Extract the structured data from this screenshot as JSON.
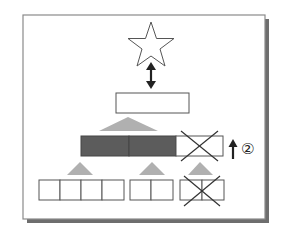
{
  "diagram": {
    "step_label": "②",
    "colors": {
      "frame_border": "#8a8a8a",
      "frame_shadow": "#6e6e6e",
      "dark_cell": "#5c5c5c",
      "triangle": "#b0b0b0",
      "line": "#333333"
    },
    "nodes": {
      "star": {
        "shape": "star",
        "fill": "none"
      },
      "root": {
        "shape": "rect",
        "cells": 1
      },
      "middle_row": {
        "cells": [
          {
            "state": "filled"
          },
          {
            "state": "filled"
          },
          {
            "state": "crossed"
          }
        ]
      },
      "bottom_groups": [
        {
          "cells": 4,
          "state": "empty"
        },
        {
          "cells": 2,
          "state": "empty"
        },
        {
          "cells": 2,
          "state": "crossed"
        }
      ]
    },
    "arrows": [
      {
        "type": "double-vertical",
        "between": [
          "star",
          "root"
        ]
      },
      {
        "type": "up",
        "beside": "middle_row",
        "label": "②"
      }
    ]
  }
}
